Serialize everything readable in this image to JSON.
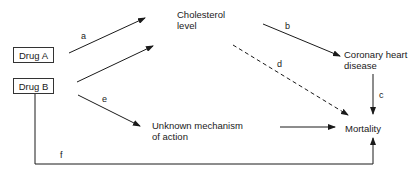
{
  "diagram": {
    "nodes": {
      "drug_a": "Drug A",
      "drug_b": "Drug B",
      "cholesterol": [
        "Cholesterol",
        "level"
      ],
      "chd": [
        "Coronary heart",
        "disease"
      ],
      "unknown": [
        "Unknown mechanism",
        "of action"
      ],
      "mortality": "Mortality"
    },
    "edges": {
      "a": "a",
      "b": "b",
      "c": "c",
      "d": "d",
      "e": "e",
      "f": "f"
    },
    "edge_list": [
      {
        "label": "a",
        "from": "Drug A",
        "to": "Cholesterol level",
        "style": "solid"
      },
      {
        "label": "",
        "from": "Drug B",
        "to": "Cholesterol level",
        "style": "solid"
      },
      {
        "label": "b",
        "from": "Cholesterol level",
        "to": "Coronary heart disease",
        "style": "solid"
      },
      {
        "label": "c",
        "from": "Coronary heart disease",
        "to": "Mortality",
        "style": "solid"
      },
      {
        "label": "d",
        "from": "Cholesterol level",
        "to": "Mortality",
        "style": "dashed"
      },
      {
        "label": "e",
        "from": "Drug B",
        "to": "Unknown mechanism of action",
        "style": "solid"
      },
      {
        "label": "",
        "from": "Unknown mechanism of action",
        "to": "Mortality",
        "style": "solid"
      },
      {
        "label": "f",
        "from": "Drug B",
        "to": "Mortality",
        "style": "solid"
      }
    ]
  }
}
